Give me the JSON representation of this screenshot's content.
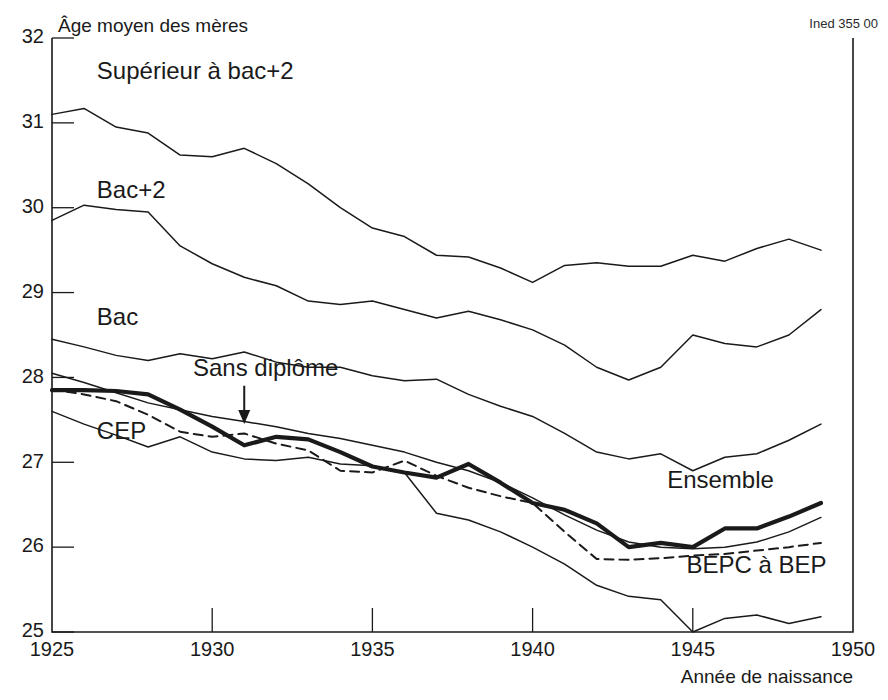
{
  "figure": {
    "source_note": "Ined 355 00",
    "y_axis_title": "Âge moyen des mères",
    "x_axis_title": "Année de naissance"
  },
  "chart_data": {
    "type": "line",
    "title": "Âge moyen des mères",
    "xlabel": "Année de naissance",
    "ylabel": "Âge moyen des mères",
    "xlim": [
      1925,
      1950
    ],
    "ylim": [
      25,
      32
    ],
    "xticks": [
      1925,
      1930,
      1935,
      1940,
      1945,
      1950
    ],
    "yticks": [
      25,
      26,
      27,
      28,
      29,
      30,
      31,
      32
    ],
    "grid": false,
    "legend": "inline-labels",
    "annotations": [
      {
        "text": "Sans diplôme",
        "points_to_x": 1931.0,
        "points_to_y": 27.45,
        "label_x": 1929.4,
        "label_y": 28.02
      }
    ],
    "x": [
      1925,
      1926,
      1927,
      1928,
      1929,
      1930,
      1931,
      1932,
      1933,
      1934,
      1935,
      1936,
      1937,
      1938,
      1939,
      1940,
      1941,
      1942,
      1943,
      1944,
      1945,
      1946,
      1947,
      1948,
      1949
    ],
    "series": [
      {
        "name": "Supérieur à bac+2",
        "style": "thin",
        "label_x": 1926.4,
        "label_y": 31.52,
        "values": [
          31.1,
          31.17,
          30.95,
          30.88,
          30.62,
          30.6,
          30.7,
          30.52,
          30.28,
          30.0,
          29.76,
          29.66,
          29.44,
          29.42,
          29.29,
          29.12,
          29.32,
          29.35,
          29.31,
          29.31,
          29.44,
          29.37,
          29.52,
          29.63,
          29.5
        ]
      },
      {
        "name": "Bac+2",
        "style": "thin",
        "label_x": 1926.4,
        "label_y": 30.12,
        "values": [
          29.85,
          30.03,
          29.98,
          29.95,
          29.55,
          29.34,
          29.18,
          29.08,
          28.9,
          28.86,
          28.9,
          28.8,
          28.7,
          28.78,
          28.68,
          28.56,
          28.38,
          28.12,
          27.97,
          28.12,
          28.5,
          28.4,
          28.36,
          28.5,
          28.8
        ]
      },
      {
        "name": "Bac",
        "style": "thin",
        "label_x": 1926.4,
        "label_y": 28.62,
        "values": [
          28.45,
          28.36,
          28.26,
          28.2,
          28.28,
          28.22,
          28.3,
          28.18,
          28.12,
          28.12,
          28.02,
          27.96,
          27.98,
          27.8,
          27.66,
          27.54,
          27.34,
          27.12,
          27.04,
          27.1,
          26.9,
          27.06,
          27.1,
          27.26,
          27.45
        ]
      },
      {
        "name": "Sans diplôme",
        "style": "thin",
        "label_x": 1929.4,
        "label_y": 28.02,
        "values": [
          28.05,
          27.94,
          27.82,
          27.7,
          27.62,
          27.54,
          27.48,
          27.42,
          27.34,
          27.28,
          27.2,
          27.12,
          27.0,
          26.9,
          26.76,
          26.58,
          26.38,
          26.2,
          26.06,
          26.0,
          25.98,
          26.0,
          26.06,
          26.18,
          26.35
        ]
      },
      {
        "name": "Ensemble",
        "style": "thick",
        "label_x": 1944.2,
        "label_y": 26.7,
        "values": [
          27.85,
          27.85,
          27.84,
          27.8,
          27.62,
          27.42,
          27.2,
          27.3,
          27.27,
          27.12,
          26.95,
          26.88,
          26.82,
          26.98,
          26.76,
          26.52,
          26.44,
          26.28,
          26.0,
          26.05,
          26.0,
          26.22,
          26.22,
          26.36,
          26.52
        ]
      },
      {
        "name": "BEPC à BEP",
        "style": "dashed",
        "label_x": 1944.8,
        "label_y": 25.7,
        "values": [
          27.86,
          27.8,
          27.72,
          27.56,
          27.36,
          27.3,
          27.34,
          27.22,
          27.14,
          26.9,
          26.88,
          27.02,
          26.84,
          26.7,
          26.6,
          26.52,
          26.18,
          25.86,
          25.85,
          25.87,
          25.9,
          25.92,
          25.96,
          26.0,
          26.05
        ]
      },
      {
        "name": "CEP",
        "style": "thin",
        "label_x": 1926.4,
        "label_y": 27.28,
        "values": [
          27.6,
          27.45,
          27.32,
          27.18,
          27.3,
          27.12,
          27.04,
          27.02,
          27.06,
          26.98,
          26.96,
          26.88,
          26.4,
          26.32,
          26.18,
          26.0,
          25.8,
          25.55,
          25.42,
          25.38,
          25.0,
          25.16,
          25.2,
          25.1,
          25.18
        ]
      }
    ]
  }
}
